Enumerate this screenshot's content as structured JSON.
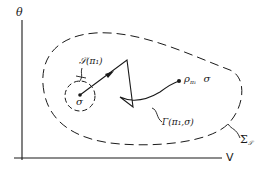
{
  "axes": {
    "y_label": "θ",
    "x_label": "V"
  },
  "labels": {
    "initial_point": "σ",
    "neighborhood": "𝒮(π₁)",
    "endpoint_rho": "ρ",
    "endpoint_rho_sub": "π₁",
    "endpoint_sigma": "σ",
    "path": "Γ(π₁,σ)",
    "region_sigma": "Σ",
    "region_sigma_sub": "𝒮"
  },
  "colors": {
    "ink": "#1a1a1a",
    "background": "#ffffff"
  }
}
